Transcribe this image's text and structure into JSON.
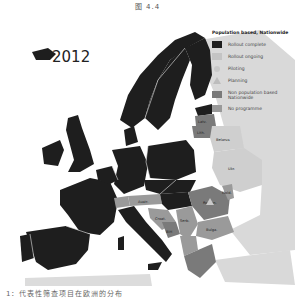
{
  "figure": {
    "title": "图 4.4",
    "year_label": "2012",
    "caption": "1：代表性筛查项目在欧洲的分布"
  },
  "legend": {
    "header": "Population based, Nationwide",
    "items": [
      {
        "label": "Rollout complete",
        "shape": "square",
        "color": "#1e1e1e"
      },
      {
        "label": "Rollout ongoing",
        "shape": "square",
        "color": "#c4c4c4"
      },
      {
        "label": "Piloting",
        "shape": "circle",
        "color": "#c8c8c8"
      },
      {
        "label": "Planning",
        "shape": "triangle",
        "color": "#bdbdbd"
      },
      {
        "label": "Non population based Nationwide",
        "shape": "square",
        "color": "#7a7a7a"
      },
      {
        "label": "No programme",
        "shape": "square",
        "color": "#9a9a9a"
      }
    ]
  },
  "map_labels": {
    "belarus": "Belarus",
    "ukraine": "Ukr.",
    "latvia": "Latv.",
    "lithuania": "Lith.",
    "romania": "Roman.",
    "bulgaria": "Bulga.",
    "serbia": "Serb.",
    "croatia": "Croat.",
    "austria": "Austr.",
    "bosnia": "BiH",
    "moldova": "Mold."
  },
  "colors": {
    "complete": "#1e1e1e",
    "ongoing": "#c4c4c4",
    "non_population": "#7a7a7a",
    "no_programme": "#9a9a9a",
    "background_land": "#d9d9d9",
    "sea": "#ffffff"
  }
}
